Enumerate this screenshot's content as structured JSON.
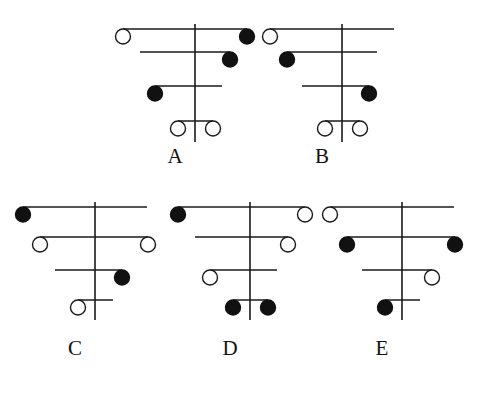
{
  "figure": {
    "background_color": "#ffffff",
    "stroke_color": "#1a1a1a",
    "filled_node_color": "#111111",
    "open_node_fill": "#ffffff",
    "node_radius": 7.5,
    "stem_width": 1.6,
    "branch_width": 1.4,
    "node_stroke_width": 1.4,
    "width": 486,
    "height": 400
  },
  "diagrams": [
    {
      "id": "A",
      "label": "A",
      "origin_x": 115,
      "origin_y": 14,
      "label_x": 175,
      "label_y": 146,
      "stem": {
        "x": 80,
        "y_top": 10,
        "y_bottom": 128
      },
      "rows": [
        {
          "index": 1,
          "y": 15,
          "x_left": 8,
          "x_right": 132,
          "left_node": "open",
          "right_node": "filled"
        },
        {
          "index": 2,
          "y": 38,
          "x_left": 25,
          "x_right": 115,
          "left_node": "none",
          "right_node": "filled"
        },
        {
          "index": 3,
          "y": 72,
          "x_left": 40,
          "x_right": 107,
          "left_node": "filled",
          "right_node": "none"
        },
        {
          "index": 4,
          "y": 107,
          "x_left": 63,
          "x_right": 98,
          "left_node": "open",
          "right_node": "open"
        }
      ]
    },
    {
      "id": "B",
      "label": "B",
      "origin_x": 262,
      "origin_y": 14,
      "label_x": 322,
      "label_y": 146,
      "stem": {
        "x": 80,
        "y_top": 10,
        "y_bottom": 128
      },
      "rows": [
        {
          "index": 1,
          "y": 15,
          "x_left": 8,
          "x_right": 132,
          "left_node": "open",
          "right_node": "none"
        },
        {
          "index": 2,
          "y": 38,
          "x_left": 25,
          "x_right": 115,
          "left_node": "filled",
          "right_node": "none"
        },
        {
          "index": 3,
          "y": 72,
          "x_left": 40,
          "x_right": 107,
          "left_node": "none",
          "right_node": "filled"
        },
        {
          "index": 4,
          "y": 107,
          "x_left": 63,
          "x_right": 98,
          "left_node": "open",
          "right_node": "open"
        }
      ]
    },
    {
      "id": "C",
      "label": "C",
      "origin_x": 15,
      "origin_y": 192,
      "label_x": 75,
      "label_y": 338,
      "stem": {
        "x": 80,
        "y_top": 10,
        "y_bottom": 128
      },
      "rows": [
        {
          "index": 1,
          "y": 15,
          "x_left": 8,
          "x_right": 132,
          "left_node": "filled",
          "right_node": "none"
        },
        {
          "index": 2,
          "y": 45,
          "x_left": 25,
          "x_right": 133,
          "left_node": "open",
          "right_node": "open"
        },
        {
          "index": 3,
          "y": 78,
          "x_left": 40,
          "x_right": 107,
          "left_node": "none",
          "right_node": "filled"
        },
        {
          "index": 4,
          "y": 108,
          "x_left": 63,
          "x_right": 98,
          "left_node": "open",
          "right_node": "none"
        }
      ]
    },
    {
      "id": "D",
      "label": "D",
      "origin_x": 170,
      "origin_y": 192,
      "label_x": 230,
      "label_y": 338,
      "stem": {
        "x": 80,
        "y_top": 10,
        "y_bottom": 128
      },
      "rows": [
        {
          "index": 1,
          "y": 15,
          "x_left": 8,
          "x_right": 135,
          "left_node": "filled",
          "right_node": "open"
        },
        {
          "index": 2,
          "y": 45,
          "x_left": 25,
          "x_right": 118,
          "left_node": "none",
          "right_node": "open"
        },
        {
          "index": 3,
          "y": 78,
          "x_left": 40,
          "x_right": 107,
          "left_node": "open",
          "right_node": "none"
        },
        {
          "index": 4,
          "y": 108,
          "x_left": 63,
          "x_right": 98,
          "left_node": "filled",
          "right_node": "filled"
        }
      ]
    },
    {
      "id": "E",
      "label": "E",
      "origin_x": 322,
      "origin_y": 192,
      "label_x": 382,
      "label_y": 338,
      "stem": {
        "x": 80,
        "y_top": 10,
        "y_bottom": 128
      },
      "rows": [
        {
          "index": 1,
          "y": 15,
          "x_left": 8,
          "x_right": 132,
          "left_node": "open",
          "right_node": "none"
        },
        {
          "index": 2,
          "y": 45,
          "x_left": 25,
          "x_right": 133,
          "left_node": "filled",
          "right_node": "filled"
        },
        {
          "index": 3,
          "y": 78,
          "x_left": 40,
          "x_right": 110,
          "left_node": "none",
          "right_node": "open"
        },
        {
          "index": 4,
          "y": 108,
          "x_left": 63,
          "x_right": 98,
          "left_node": "filled",
          "right_node": "none"
        }
      ]
    }
  ]
}
